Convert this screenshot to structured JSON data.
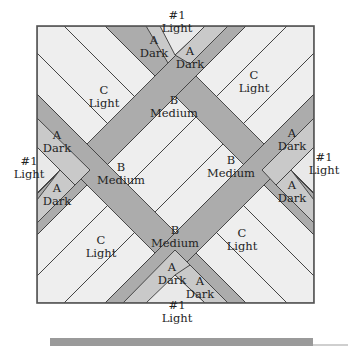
{
  "diagram": {
    "fabric_colors": {
      "light_1": "#e9e9e9",
      "dark_a": "#c9c9c9",
      "medium_b": "#acacac",
      "light_c": "#eeeeee"
    },
    "labels": {
      "top_1": [
        "#1",
        "Light"
      ],
      "top_a_left": [
        "A",
        "Dark"
      ],
      "top_a_right": [
        "A",
        "Dark"
      ],
      "top_b": [
        "B",
        "Medium"
      ],
      "left_c": [
        "C",
        "Light"
      ],
      "right_c_top": [
        "C",
        "Light"
      ],
      "left_a_top": [
        "A",
        "Dark"
      ],
      "left_1": [
        "#1",
        "Light"
      ],
      "left_a_bottom": [
        "A",
        "Dark"
      ],
      "left_b": [
        "B",
        "Medium"
      ],
      "right_b": [
        "B",
        "Medium"
      ],
      "right_a_top": [
        "A",
        "Dark"
      ],
      "right_1": [
        "#1",
        "Light"
      ],
      "right_a_bottom": [
        "A",
        "Dark"
      ],
      "bottom_c_left": [
        "C",
        "Light"
      ],
      "bottom_b": [
        "B",
        "Medium"
      ],
      "bottom_c_right": [
        "C",
        "Light"
      ],
      "bottom_a_left": [
        "A",
        "Dark"
      ],
      "bottom_a_right": [
        "A",
        "Dark"
      ],
      "bottom_1": [
        "#1",
        "Light"
      ]
    }
  }
}
